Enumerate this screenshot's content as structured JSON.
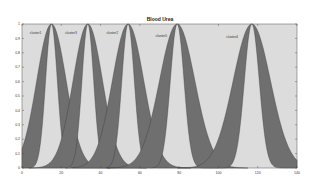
{
  "chart_data": {
    "type": "area",
    "title": "Blood Urea",
    "xlabel": "",
    "ylabel": "",
    "xlim": [
      0,
      140
    ],
    "ylim": [
      0,
      1
    ],
    "xticks": [
      0,
      20,
      40,
      60,
      80,
      100,
      120,
      140
    ],
    "yticks": [
      0,
      0.1,
      0.2,
      0.3,
      0.4,
      0.5,
      0.6,
      0.7,
      0.8,
      0.9,
      1
    ],
    "grid": false,
    "legend": "none",
    "colors": {
      "fou": "#6f6f6f",
      "plot_bg": "#dcdcdc",
      "edge": "#3a3a3a"
    },
    "series": [
      {
        "name": "cluster1",
        "center": 15,
        "sigma_upper": 7.5,
        "sigma_lower": 3.0,
        "label_x": 4,
        "label_y": 0.93
      },
      {
        "name": "cluster3",
        "center": 33.5,
        "sigma_upper": 7.5,
        "sigma_lower": 3.0,
        "label_x": 22,
        "label_y": 0.93
      },
      {
        "name": "cluster2",
        "center": 54,
        "sigma_upper": 8.0,
        "sigma_lower": 3.2,
        "label_x": 43,
        "label_y": 0.93
      },
      {
        "name": "cluster5",
        "center": 79,
        "sigma_upper": 9.0,
        "sigma_lower": 3.5,
        "label_x": 68,
        "label_y": 0.91
      },
      {
        "name": "cluster4",
        "center": 117,
        "sigma_upper": 9.5,
        "sigma_lower": 3.8,
        "label_x": 104,
        "label_y": 0.9
      }
    ]
  }
}
